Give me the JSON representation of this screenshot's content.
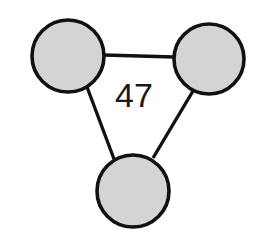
{
  "diagram": {
    "type": "node-link-graph",
    "shape": "triangle",
    "background_color": "#ffffff",
    "canvas": {
      "width": 258,
      "height": 246
    },
    "style": {
      "node_fill": "#d4d4d4",
      "node_stroke": "#111111",
      "node_stroke_width": 3.6,
      "edge_stroke": "#111111",
      "edge_stroke_width": 3.4,
      "label_color": "#1a1a1a",
      "label_font_size": 34
    },
    "nodes": [
      {
        "id": "node-top-left",
        "name": "top-left-node",
        "label": "",
        "cx": 68,
        "cy": 56,
        "r": 36
      },
      {
        "id": "node-top-right",
        "name": "top-right-node",
        "label": "",
        "cx": 209,
        "cy": 59,
        "r": 35
      },
      {
        "id": "node-bottom",
        "name": "bottom-node",
        "label": "",
        "cx": 133,
        "cy": 191,
        "r": 36
      }
    ],
    "edges": [
      {
        "id": "edge-top",
        "name": "edge-top-left-to-top-right",
        "source": "node-top-left",
        "target": "node-top-right",
        "x1": 104,
        "y1": 55,
        "x2": 174,
        "y2": 57,
        "label": ""
      },
      {
        "id": "edge-left",
        "name": "edge-top-left-to-bottom",
        "source": "node-top-left",
        "target": "node-bottom",
        "x1": 87,
        "y1": 87,
        "x2": 114,
        "y2": 159,
        "label": ""
      },
      {
        "id": "edge-right",
        "name": "edge-top-right-to-bottom",
        "source": "node-top-right",
        "target": "node-bottom",
        "x1": 193,
        "y1": 91,
        "x2": 153,
        "y2": 158,
        "label": ""
      }
    ],
    "labels": [
      {
        "id": "label-47",
        "name": "center-value-label",
        "text": "47",
        "x": 134,
        "y": 98
      }
    ]
  }
}
